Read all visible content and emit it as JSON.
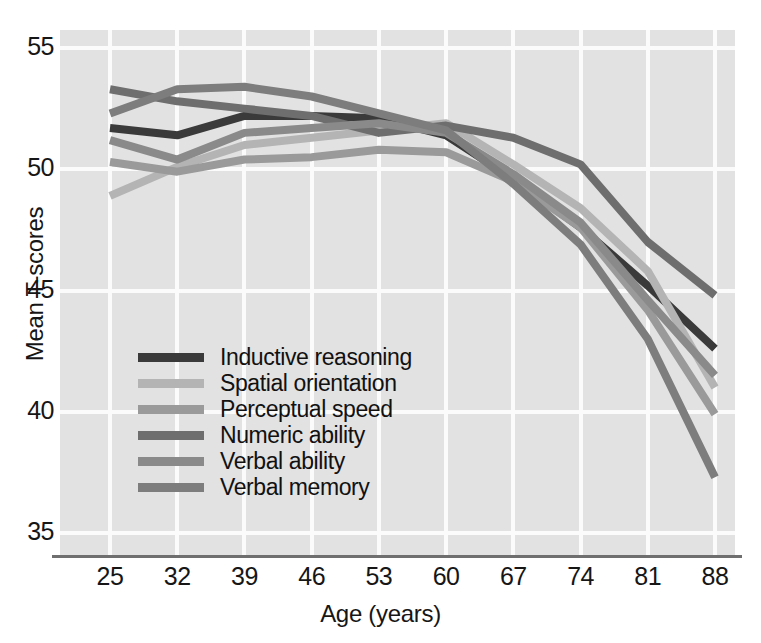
{
  "chart_data": {
    "type": "line",
    "title": "",
    "xlabel": "Age (years)",
    "ylabel": "Mean T-scores",
    "x": [
      25,
      32,
      39,
      46,
      53,
      60,
      67,
      74,
      81,
      88
    ],
    "xtick_labels": [
      "25",
      "32",
      "39",
      "46",
      "53",
      "60",
      "67",
      "74",
      "81",
      "88"
    ],
    "ytick_labels": [
      "55",
      "50",
      "45",
      "40",
      "35"
    ],
    "ytick_values": [
      55,
      50,
      45,
      40,
      35
    ],
    "xlim": [
      25,
      88
    ],
    "ylim": [
      35,
      55
    ],
    "grid": true,
    "legend_position": "inside-lower-left",
    "series": [
      {
        "name": "Inductive reasoning",
        "color": "#3a3a3a",
        "values": [
          51.7,
          51.4,
          52.2,
          52.2,
          52.1,
          51.4,
          49.6,
          47.6,
          45.2,
          42.6
        ]
      },
      {
        "name": "Spatial orientation",
        "color": "#b4b4b4",
        "values": [
          48.9,
          50.1,
          51.0,
          51.3,
          51.6,
          51.9,
          50.2,
          48.4,
          45.8,
          41.0
        ]
      },
      {
        "name": "Perceptual speed",
        "color": "#9a9a9a",
        "values": [
          50.3,
          49.9,
          50.4,
          50.5,
          50.8,
          50.7,
          49.5,
          47.6,
          44.2,
          39.9
        ]
      },
      {
        "name": "Numeric ability",
        "color": "#6e6e6e",
        "values": [
          53.3,
          52.8,
          52.5,
          52.2,
          51.5,
          51.8,
          51.3,
          50.2,
          47.0,
          44.8
        ]
      },
      {
        "name": "Verbal ability",
        "color": "#8a8a8a",
        "values": [
          51.2,
          50.4,
          51.5,
          51.7,
          51.9,
          51.5,
          49.8,
          47.8,
          44.6,
          41.5
        ]
      },
      {
        "name": "Verbal memory",
        "color": "#7d7d7d",
        "values": [
          52.3,
          53.3,
          53.4,
          53.0,
          52.3,
          51.6,
          49.4,
          46.9,
          43.0,
          37.3
        ]
      }
    ]
  },
  "axes": {
    "y_title": "Mean T-scores",
    "x_title": "Age (years)"
  },
  "legend": {
    "items": [
      {
        "label": "Inductive reasoning",
        "color": "#3a3a3a"
      },
      {
        "label": "Spatial orientation",
        "color": "#b4b4b4"
      },
      {
        "label": "Perceptual speed",
        "color": "#9a9a9a"
      },
      {
        "label": "Numeric ability",
        "color": "#6e6e6e"
      },
      {
        "label": "Verbal ability",
        "color": "#8a8a8a"
      },
      {
        "label": "Verbal memory",
        "color": "#7d7d7d"
      }
    ]
  },
  "colors": {
    "plot_background": "#e2e2e2",
    "gridline": "#fbfbfb",
    "axis_line": "#6f6f6f",
    "text": "#161616"
  }
}
